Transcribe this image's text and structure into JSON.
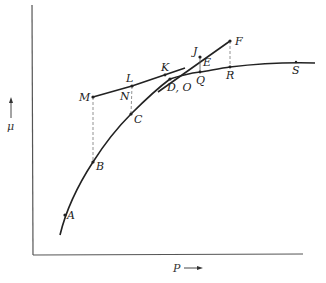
{
  "diagram": {
    "axes": {
      "x_label": "P",
      "y_label": "μ",
      "x_arrow": "right-arrow",
      "y_arrow": "up-arrow"
    },
    "points": {
      "A": "A",
      "B": "B",
      "C": "C",
      "DO": "D, O",
      "E": "E",
      "F": "F",
      "J": "J",
      "K": "K",
      "L": "L",
      "M": "M",
      "N": "N",
      "Q": "Q",
      "R": "R",
      "S": "S"
    },
    "colors": {
      "line": "#222222",
      "axis": "#555555",
      "dashed": "#777777"
    }
  }
}
